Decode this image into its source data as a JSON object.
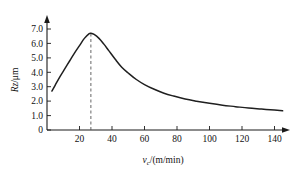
{
  "chart_data": {
    "type": "line",
    "title": "",
    "subtitle": "",
    "xlabel": "v_c/(m/min)",
    "xlabel_parts": {
      "symbol": "v",
      "subscript": "c",
      "units": "/(m/min)"
    },
    "ylabel": "Rz/μm",
    "ylabel_parts": {
      "symbol": "Rz",
      "units": "/μm"
    },
    "xlim": [
      0,
      150
    ],
    "ylim": [
      0,
      7.6
    ],
    "xticks": [
      20,
      40,
      60,
      80,
      100,
      120,
      140
    ],
    "xtick_labels": [
      "20",
      "40",
      "60",
      "80",
      "100",
      "120",
      "140"
    ],
    "yticks": [
      0,
      1.0,
      2.0,
      3.0,
      4.0,
      5.0,
      6.0,
      7.0
    ],
    "ytick_labels": [
      "0",
      "1.0",
      "2.0",
      "3.0",
      "4.0",
      "5.0",
      "6.0",
      "7.0"
    ],
    "grid": false,
    "legend": false,
    "legend_position": "none",
    "axis_arrows": true,
    "series": [
      {
        "name": "Rz vs cutting speed",
        "color": "#1f1f1f",
        "x": [
          3,
          5,
          8,
          11,
          14,
          17,
          20,
          23,
          26,
          27,
          29,
          32,
          35,
          38,
          42,
          46,
          50,
          55,
          60,
          66,
          72,
          78,
          85,
          92,
          100,
          108,
          116,
          124,
          132,
          140,
          145
        ],
        "values": [
          2.7,
          3.1,
          3.7,
          4.25,
          4.8,
          5.35,
          5.85,
          6.35,
          6.68,
          6.7,
          6.62,
          6.35,
          5.95,
          5.5,
          4.9,
          4.35,
          3.95,
          3.5,
          3.15,
          2.82,
          2.55,
          2.35,
          2.15,
          2.0,
          1.85,
          1.72,
          1.62,
          1.52,
          1.45,
          1.38,
          1.33
        ]
      }
    ],
    "annotations": [
      {
        "name": "peak-guide-line",
        "type": "vertical-dashed-line",
        "x": 27,
        "y_from": 0,
        "y_to": 6.7,
        "color": "#555555"
      }
    ],
    "peak": {
      "x": 27,
      "y": 6.7
    }
  }
}
